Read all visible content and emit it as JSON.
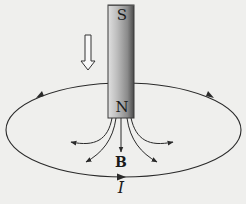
{
  "diagram": {
    "magnet": {
      "top_pole_label": "S",
      "bottom_pole_label": "N"
    },
    "motion_arrow": {
      "direction": "down",
      "style": "hollow"
    },
    "field_label": "B",
    "current_label": "I",
    "loop": {
      "shape": "ellipse",
      "arrow_direction": "counterclockwise-viewed-from-above"
    },
    "colors": {
      "background": "#efefed",
      "line": "#2a2a2a",
      "magnet_light": "#d2d2d2",
      "magnet_dark": "#5a5a5a"
    }
  }
}
